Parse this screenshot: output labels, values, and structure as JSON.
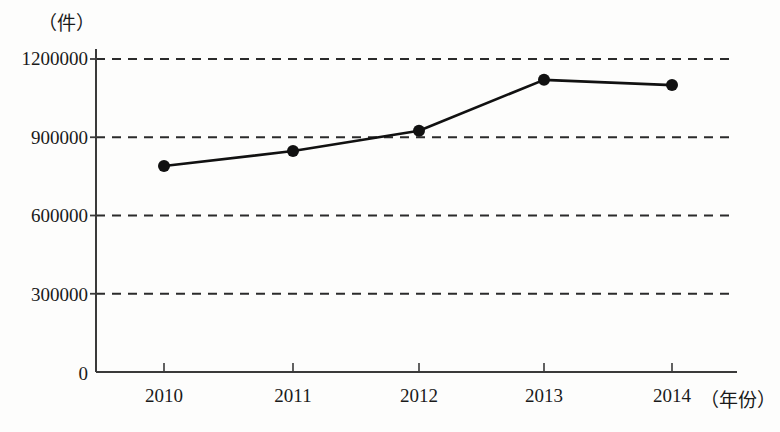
{
  "chart_data": {
    "type": "line",
    "title": "",
    "subtitle": "",
    "xlabel": "（年份）",
    "ylabel": "（件）",
    "categories": [
      "2010",
      "2011",
      "2012",
      "2013",
      "2014"
    ],
    "x": [
      2010,
      2011,
      2012,
      2013,
      2014
    ],
    "values": [
      790000,
      847000,
      925000,
      1120000,
      1100000
    ],
    "series": [
      {
        "name": "",
        "values": [
          790000,
          847000,
          925000,
          1120000,
          1100000
        ]
      }
    ],
    "ylim": [
      0,
      1200000
    ],
    "y_ticks": [
      0,
      300000,
      600000,
      900000,
      1200000
    ],
    "y_tick_labels": [
      "0",
      "300000",
      "600000",
      "900000",
      "1200000"
    ],
    "x_tick_labels": [
      "2010",
      "2011",
      "2012",
      "2013",
      "2014"
    ],
    "grid": true,
    "grid_style": "dashed-horizontal",
    "legend": false,
    "legend_position": "none",
    "marker": "filled-circle",
    "line_color": "#111111",
    "marker_color": "#111111",
    "grid_color": "#2b2b2b",
    "axis_color": "#3a3a3a",
    "background_color": "#fdfdfc",
    "annotations": []
  },
  "layout": {
    "plot_left": 96,
    "plot_right": 735,
    "plot_top": 59,
    "plot_bottom": 372,
    "point_x": [
      164,
      293,
      419,
      544,
      672
    ],
    "point_y": [
      165,
      151,
      130,
      76,
      83
    ],
    "gridline_y": [
      59,
      138,
      216,
      295
    ],
    "tick_label_y": [
      59,
      138,
      216,
      295,
      372
    ]
  }
}
